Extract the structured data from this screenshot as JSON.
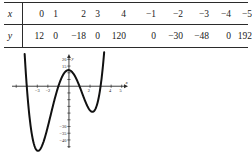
{
  "table": {
    "row_labels": {
      "x": "x",
      "y": "y"
    },
    "x_values": [
      "0",
      "1",
      "2",
      "3",
      "4",
      "−1",
      "−2",
      "−3",
      "−4",
      "−5"
    ],
    "y_values": [
      "12",
      "0",
      "−18",
      "0",
      "120",
      "0",
      "−30",
      "−48",
      "0",
      "192"
    ]
  },
  "chart_data": {
    "type": "line",
    "title": "",
    "xlabel": "x",
    "ylabel": "y",
    "xlim": [
      -5.4,
      5.6
    ],
    "ylim": [
      -46,
      24
    ],
    "grid": false,
    "legend": "none",
    "x_tick_labels": [
      "−3",
      "−2",
      "2",
      "4",
      "5"
    ],
    "x_tick_values": [
      -3,
      -2,
      2,
      4,
      5
    ],
    "y_tick_labels": [
      "20",
      "15",
      "−30",
      "−35",
      "−40"
    ],
    "y_tick_values": [
      20,
      15,
      -30,
      -35,
      -40
    ],
    "x": [
      -5,
      -4,
      -3,
      -2,
      -1,
      0,
      1,
      2,
      3,
      4
    ],
    "y": [
      192,
      0,
      -48,
      -30,
      0,
      12,
      0,
      -18,
      0,
      120
    ],
    "series": [
      {
        "name": "y",
        "values": [
          192,
          0,
          -48,
          -30,
          0,
          12,
          0,
          -18,
          0,
          120
        ]
      }
    ],
    "roots": [
      -4,
      -1,
      1,
      3
    ],
    "local_maximum": {
      "x": 0,
      "y": 12
    },
    "local_minima": [
      {
        "x": -3,
        "y": -48
      },
      {
        "x": 2,
        "y": -18
      }
    ]
  }
}
